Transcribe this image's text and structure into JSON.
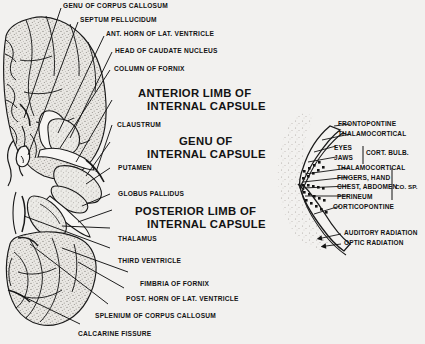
{
  "figure": {
    "title_present": false,
    "background_color": "#f2f1ef",
    "ink_color": "#131313",
    "panels": [
      {
        "name": "horizontal-brain-section",
        "description": "horizontal section of cerebrum showing internal capsule"
      },
      {
        "name": "internal-capsule-somatotopy",
        "description": "enlarged V-shaped internal capsule with fiber tracts"
      }
    ]
  },
  "left_labels": [
    {
      "id": "genu-corpus-callosum",
      "text": "GENU OF CORPUS CALLOSUM",
      "size": "sm"
    },
    {
      "id": "septum-pellucidum",
      "text": "SEPTUM PELLUCIDUM",
      "size": "sm"
    },
    {
      "id": "ant-horn-lat-ventricle",
      "text": "ANT. HORN OF LAT. VENTRICLE",
      "size": "sm"
    },
    {
      "id": "head-of-caudate-nucleus",
      "text": "HEAD OF CAUDATE NUCLEUS",
      "size": "sm"
    },
    {
      "id": "column-of-fornix",
      "text": "COLUMN OF FORNIX",
      "size": "sm"
    },
    {
      "id": "anterior-limb-line1",
      "text": "ANTERIOR LIMB OF",
      "size": "big"
    },
    {
      "id": "anterior-limb-line2",
      "text": "INTERNAL CAPSULE",
      "size": "big"
    },
    {
      "id": "claustrum",
      "text": "CLAUSTRUM",
      "size": "sm"
    },
    {
      "id": "genu-internal-capsule-line1",
      "text": "GENU  OF",
      "size": "big"
    },
    {
      "id": "genu-internal-capsule-line2",
      "text": "INTERNAL CAPSULE",
      "size": "big"
    },
    {
      "id": "putamen",
      "text": "PUTAMEN",
      "size": "sm"
    },
    {
      "id": "globus-pallidus",
      "text": "GLOBUS PALLIDUS",
      "size": "sm"
    },
    {
      "id": "posterior-limb-line1",
      "text": "POSTERIOR LIMB OF",
      "size": "big"
    },
    {
      "id": "posterior-limb-line2",
      "text": "INTERNAL CAPSULE",
      "size": "big"
    },
    {
      "id": "thalamus",
      "text": "THALAMUS",
      "size": "sm"
    },
    {
      "id": "third-ventricle",
      "text": "THIRD VENTRICLE",
      "size": "sm"
    },
    {
      "id": "fimbria-of-fornix",
      "text": "FIMBRIA OF FORNIX",
      "size": "sm"
    },
    {
      "id": "post-horn-lat-ventricle",
      "text": "POST. HORN OF LAT. VENTRICLE",
      "size": "sm"
    },
    {
      "id": "splenium-corpus-callosum",
      "text": "SPLENIUM OF CORPUS CALLOSUM",
      "size": "sm"
    },
    {
      "id": "calcarine-fissure",
      "text": "CALCARINE FISSURE",
      "size": "sm"
    }
  ],
  "right_labels": [
    {
      "id": "frontopontine",
      "text": "FRONTOPONTINE"
    },
    {
      "id": "thalamocortical-1",
      "text": "THALAMOCORTICAL"
    },
    {
      "id": "eyes",
      "text": "EYES"
    },
    {
      "id": "jaws",
      "text": "JAWS"
    },
    {
      "id": "cort-bulb",
      "text": "CORT. BULB."
    },
    {
      "id": "thalamocortical-2",
      "text": "THALAMOCORTICAL"
    },
    {
      "id": "fingers-hand",
      "text": "FINGERS, HAND"
    },
    {
      "id": "chest-abdomen",
      "text": "CHEST, ABDOMEN"
    },
    {
      "id": "co-sp",
      "text": "CO. SP."
    },
    {
      "id": "perineum",
      "text": "PERINEUM"
    },
    {
      "id": "corticopontine",
      "text": "CORTICOPONTINE"
    },
    {
      "id": "auditory-radiation",
      "text": "AUDITORY RADIATION"
    },
    {
      "id": "optic-radiation",
      "text": "OPTIC RADIATION"
    }
  ]
}
